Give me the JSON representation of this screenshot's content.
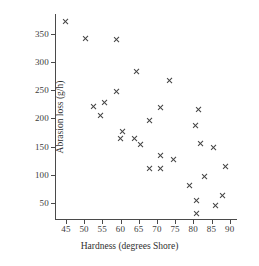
{
  "chart_data": {
    "type": "scatter",
    "title": "",
    "xlabel": "Hardness (degrees Shore)",
    "ylabel": "Abrasion loss (g/h)",
    "xlim": [
      42,
      92
    ],
    "ylim": [
      20,
      385
    ],
    "xticks": [
      45,
      50,
      55,
      60,
      65,
      70,
      75,
      80,
      85,
      90
    ],
    "yticks": [
      50,
      100,
      150,
      200,
      250,
      300,
      350
    ],
    "grid": false,
    "legend": false,
    "marker": "x",
    "marker_color": "#424242",
    "points": [
      {
        "x": 45,
        "y": 372
      },
      {
        "x": 50.5,
        "y": 341
      },
      {
        "x": 59,
        "y": 340
      },
      {
        "x": 64.5,
        "y": 283
      },
      {
        "x": 73.5,
        "y": 267
      },
      {
        "x": 59,
        "y": 248
      },
      {
        "x": 55.5,
        "y": 228
      },
      {
        "x": 52.5,
        "y": 221
      },
      {
        "x": 71,
        "y": 220
      },
      {
        "x": 81.5,
        "y": 216
      },
      {
        "x": 54.5,
        "y": 205
      },
      {
        "x": 68,
        "y": 196
      },
      {
        "x": 80.5,
        "y": 187
      },
      {
        "x": 60.5,
        "y": 176
      },
      {
        "x": 60,
        "y": 165
      },
      {
        "x": 64,
        "y": 164
      },
      {
        "x": 82,
        "y": 155
      },
      {
        "x": 65.5,
        "y": 153
      },
      {
        "x": 85.5,
        "y": 148
      },
      {
        "x": 71,
        "y": 135
      },
      {
        "x": 74.5,
        "y": 128
      },
      {
        "x": 89,
        "y": 114
      },
      {
        "x": 68,
        "y": 112
      },
      {
        "x": 71,
        "y": 112
      },
      {
        "x": 83,
        "y": 97
      },
      {
        "x": 79,
        "y": 82
      },
      {
        "x": 88,
        "y": 64
      },
      {
        "x": 81,
        "y": 55
      },
      {
        "x": 86,
        "y": 45
      },
      {
        "x": 81,
        "y": 32
      }
    ]
  },
  "axis": {
    "x_title": "Hardness (degrees Shore)",
    "y_title": "Abrasion loss (g/h)"
  }
}
